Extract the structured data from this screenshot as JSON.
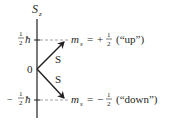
{
  "axis": {
    "label_main": "S",
    "label_sub": "z",
    "origin_label": "0"
  },
  "levels": {
    "upper": {
      "tick_sign": "",
      "tick_num": "1",
      "tick_den": "2",
      "tick_unit": "ħ",
      "m_label": "m",
      "m_sub": "s",
      "equals": "=",
      "sign": "+",
      "num": "1",
      "den": "2",
      "desc": "(“up”)"
    },
    "lower": {
      "tick_sign": "−",
      "tick_num": "1",
      "tick_den": "2",
      "tick_unit": "ħ",
      "m_label": "m",
      "m_sub": "s",
      "equals": "=",
      "sign": "−",
      "num": "1",
      "den": "2",
      "desc": "(“down”)"
    }
  },
  "vectors": {
    "up_label": "S",
    "down_label": "S"
  },
  "colors": {
    "ink": "#231f20",
    "dash": "#8c8c8c",
    "background": "#ffffff"
  }
}
